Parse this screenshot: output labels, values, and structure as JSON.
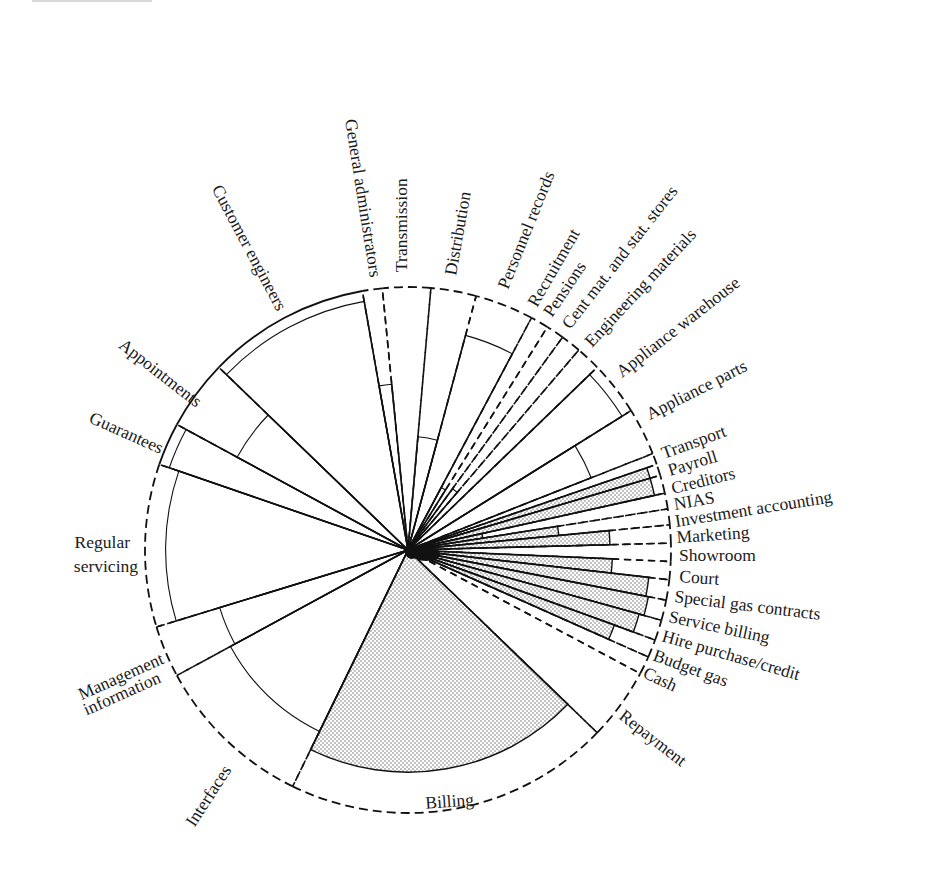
{
  "chart_data": {
    "type": "polar-area (radial segmented pie)",
    "title": "",
    "center": [
      408,
      550
    ],
    "outer_radius": 263,
    "segments": [
      {
        "label": "General administrators",
        "start": 95.6,
        "end": 100,
        "inner": 0.66,
        "fill": "none",
        "outer_style": "dashed"
      },
      {
        "label": "Transmission",
        "start": 85,
        "end": 95.6,
        "inner": 0.0,
        "fill": "none",
        "outer_style": "dashed"
      },
      {
        "label": "Distribution",
        "start": 75,
        "end": 85,
        "inner": 0.45,
        "fill": "none",
        "outer_style": "dashed"
      },
      {
        "label": "Personnel records",
        "start": 62,
        "end": 75,
        "inner": 0.88,
        "fill": "none",
        "outer_style": "dashed"
      },
      {
        "label": "Recruitment",
        "start": 58,
        "end": 62,
        "inner": 0.28,
        "fill": "none",
        "outer_style": "dashed"
      },
      {
        "label": "Pensions",
        "start": 54,
        "end": 58,
        "inner": 0.0,
        "fill": "none",
        "outer_style": "dashed"
      },
      {
        "label": "Cent mat. and stat. stores",
        "start": 49.5,
        "end": 54,
        "inner": 0.3,
        "fill": "none",
        "outer_style": "dashed"
      },
      {
        "label": "Engineering materials",
        "start": 44,
        "end": 49.5,
        "inner": 0.0,
        "fill": "none",
        "outer_style": "dashed"
      },
      {
        "label": "Appliance warehouse",
        "start": 32,
        "end": 44,
        "inner": 1.0,
        "fill": "none",
        "outer_style": "dashed"
      },
      {
        "label": "Appliance parts",
        "start": 21.5,
        "end": 32,
        "inner": 0.78,
        "fill": "none",
        "outer_style": "dashed"
      },
      {
        "label": "Transport",
        "start": 19,
        "end": 21.5,
        "inner": 0.0,
        "fill": "none",
        "outer_style": "dashed"
      },
      {
        "label": "Payroll",
        "start": 16.5,
        "end": 19,
        "inner": 1.0,
        "fill": "dotted",
        "outer_style": "dashed"
      },
      {
        "label": "Creditors",
        "start": 12.5,
        "end": 16.5,
        "inner": 1.0,
        "fill": "dotted",
        "outer_style": "dashed"
      },
      {
        "label": "NIAS",
        "start": 9,
        "end": 12.5,
        "inner": 0.3,
        "fill": "dotted",
        "outer_style": "dashed"
      },
      {
        "label": "Investment accounting",
        "start": 5.5,
        "end": 9,
        "inner": 0.6,
        "fill": "dotted",
        "outer_style": "dashed"
      },
      {
        "label": "Marketing",
        "start": 1.5,
        "end": 5.5,
        "inner": 0.8,
        "fill": "dotted",
        "outer_style": "dashed"
      },
      {
        "label": "Showroom",
        "start": -2.5,
        "end": 1.5,
        "inner": 0.0,
        "fill": "none",
        "outer_style": "dashed"
      },
      {
        "label": "Court",
        "start": -6.5,
        "end": -2.5,
        "inner": 0.81,
        "fill": "dotted",
        "outer_style": "dashed"
      },
      {
        "label": "Special gas contracts",
        "start": -11,
        "end": -6.5,
        "inner": 0.96,
        "fill": "dotted",
        "outer_style": "dashed"
      },
      {
        "label": "Service billing",
        "start": -15.5,
        "end": -11,
        "inner": 0.97,
        "fill": "dotted",
        "outer_style": "dashed"
      },
      {
        "label": "Hire purchase/credit",
        "start": -20,
        "end": -15.5,
        "inner": 0.95,
        "fill": "dotted",
        "outer_style": "dashed"
      },
      {
        "label": "Budget gas",
        "start": -24,
        "end": -20,
        "inner": 0.87,
        "fill": "dotted",
        "outer_style": "dashed"
      },
      {
        "label": "Cash",
        "start": -28,
        "end": -24,
        "inner": 0.0,
        "fill": "none",
        "outer_style": "dashed"
      },
      {
        "label": "Repayment",
        "start": -44,
        "end": -28,
        "inner": 0.0,
        "fill": "none",
        "outer_style": "dashed"
      },
      {
        "label": "Billing",
        "start": -116,
        "end": -44,
        "inner": 0.88,
        "fill": "dotted",
        "outer_style": "dashed"
      },
      {
        "label": "Interfaces",
        "start": -151.5,
        "end": -116,
        "inner": 0.8,
        "fill": "none",
        "outer_style": "dashed"
      },
      {
        "label": "Management information",
        "start": -163,
        "end": -151.5,
        "inner": 0.78,
        "fill": "none",
        "outer_style": "dashed"
      },
      {
        "label": "Regular servicing",
        "start": 161,
        "end": 197,
        "inner": 0.96,
        "fill": "none",
        "outer_style": "dashed"
      },
      {
        "label": "Guarantees",
        "start": 151.5,
        "end": 161,
        "inner": 1.0,
        "fill": "none",
        "outer_style": "solid"
      },
      {
        "label": "Appointments",
        "start": 136,
        "end": 151.5,
        "inner": 0.77,
        "fill": "none",
        "outer_style": "solid"
      },
      {
        "label": "Customer engineers",
        "start": 100,
        "end": 136,
        "inner": 1.0,
        "fill": "none",
        "outer_style": "solid"
      }
    ]
  },
  "labels": {
    "general_administrators": "General administrators",
    "transmission": "Transmission",
    "distribution": "Distribution",
    "personnel_records": "Personnel records",
    "recruitment": "Recruitment",
    "pensions": "Pensions",
    "cent_mat": "Cent mat. and stat. stores",
    "engineering_materials": "Engineering materials",
    "appliance_warehouse": "Appliance warehouse",
    "appliance_parts": "Appliance parts",
    "transport": "Transport",
    "payroll": "Payroll",
    "creditors": "Creditors",
    "nias": "NIAS",
    "investment_accounting": "Investment accounting",
    "marketing": "Marketing",
    "showroom": "Showroom",
    "court": "Court",
    "special_gas": "Special gas contracts",
    "service_billing": "Service billing",
    "hire_purchase": "Hire purchase/credit",
    "budget_gas": "Budget gas",
    "cash": "Cash",
    "repayment": "Repayment",
    "billing": "Billing",
    "interfaces": "Interfaces",
    "management_1": "Management",
    "management_2": "information",
    "regular_1": "Regular",
    "regular_2": "servicing",
    "guarantees": "Guarantees",
    "appointments": "Appointments",
    "customer_engineers": "Customer engineers"
  }
}
